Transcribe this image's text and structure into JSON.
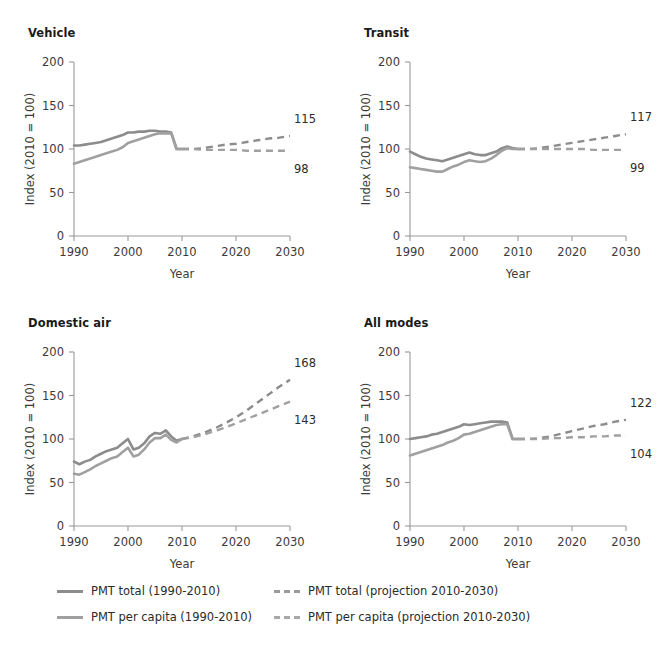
{
  "figure": {
    "width": 671,
    "height": 648,
    "background": "#ffffff"
  },
  "colors": {
    "series_total": "#8c8c8c",
    "series_per_capita": "#a0a0a0",
    "axis": "#9a9a9a",
    "text": "#2b2b2b",
    "title": "#1a1a1a"
  },
  "legend": {
    "position": "bottom",
    "items": [
      {
        "label": "PMT total (1990-2010)",
        "style": "solid",
        "color": "#8c8c8c",
        "column": "left"
      },
      {
        "label": "PMT per capita (1990-2010)",
        "style": "solid",
        "color": "#a0a0a0",
        "column": "left"
      },
      {
        "label": "PMT total (projection 2010-2030)",
        "style": "dashed",
        "color": "#9a9a9a",
        "column": "right"
      },
      {
        "label": "PMT per capita (projection 2010-2030)",
        "style": "dashed",
        "color": "#a8a8a8",
        "column": "right"
      }
    ]
  },
  "axes_common": {
    "xlabel": "Year",
    "ylabel": "Index (2010 = 100)",
    "xticks": [
      1990,
      2000,
      2010,
      2020,
      2030
    ],
    "yticks": [
      0,
      50,
      100,
      150,
      200
    ],
    "xlim": [
      1990,
      2030
    ],
    "ylim": [
      0,
      200
    ],
    "grid": false
  },
  "chart_data": [
    {
      "type": "line",
      "title": "Vehicle",
      "xlabel": "Year",
      "ylabel": "Index (2010 = 100)",
      "xlim": [
        1990,
        2030
      ],
      "ylim": [
        0,
        200
      ],
      "xticks": [
        1990,
        2000,
        2010,
        2020,
        2030
      ],
      "yticks": [
        0,
        50,
        100,
        150,
        200
      ],
      "grid": false,
      "annotations": [
        {
          "text": "115",
          "series": "PMT total (projection 2010-2030)",
          "x": 2030,
          "y": 115
        },
        {
          "text": "98",
          "series": "PMT per capita (projection 2010-2030)",
          "x": 2030,
          "y": 98
        }
      ],
      "series": [
        {
          "name": "PMT total (1990-2010)",
          "style": "solid",
          "x": [
            1990,
            1991,
            1992,
            1993,
            1994,
            1995,
            1996,
            1997,
            1998,
            1999,
            2000,
            2001,
            2002,
            2003,
            2004,
            2005,
            2006,
            2007,
            2008,
            2009,
            2010
          ],
          "values": [
            104,
            104,
            105,
            106,
            107,
            108,
            110,
            112,
            114,
            116,
            119,
            119,
            120,
            120,
            121,
            121,
            120,
            120,
            119,
            100,
            100
          ]
        },
        {
          "name": "PMT per capita (1990-2010)",
          "style": "solid",
          "x": [
            1990,
            1991,
            1992,
            1993,
            1994,
            1995,
            1996,
            1997,
            1998,
            1999,
            2000,
            2001,
            2002,
            2003,
            2004,
            2005,
            2006,
            2007,
            2008,
            2009,
            2010
          ],
          "values": [
            83,
            85,
            87,
            89,
            91,
            93,
            95,
            97,
            99,
            102,
            107,
            109,
            111,
            113,
            115,
            117,
            118,
            118,
            118,
            100,
            100
          ]
        },
        {
          "name": "PMT total (projection 2010-2030)",
          "style": "dashed",
          "x": [
            2010,
            2012,
            2014,
            2016,
            2018,
            2020,
            2022,
            2024,
            2026,
            2028,
            2030
          ],
          "values": [
            100,
            100,
            101,
            103,
            105,
            106,
            108,
            110,
            112,
            113,
            115
          ]
        },
        {
          "name": "PMT per capita (projection 2010-2030)",
          "style": "dashed",
          "x": [
            2010,
            2012,
            2014,
            2016,
            2018,
            2020,
            2022,
            2024,
            2026,
            2028,
            2030
          ],
          "values": [
            100,
            100,
            99,
            99,
            99,
            99,
            98,
            98,
            98,
            98,
            98
          ]
        }
      ]
    },
    {
      "type": "line",
      "title": "Transit",
      "xlabel": "Year",
      "ylabel": "Index (2010 = 100)",
      "xlim": [
        1990,
        2030
      ],
      "ylim": [
        0,
        200
      ],
      "xticks": [
        1990,
        2000,
        2010,
        2020,
        2030
      ],
      "yticks": [
        0,
        50,
        100,
        150,
        200
      ],
      "grid": false,
      "annotations": [
        {
          "text": "117",
          "series": "PMT total (projection 2010-2030)",
          "x": 2030,
          "y": 117
        },
        {
          "text": "99",
          "series": "PMT per capita (projection 2010-2030)",
          "x": 2030,
          "y": 99
        }
      ],
      "series": [
        {
          "name": "PMT total (1990-2010)",
          "style": "solid",
          "x": [
            1990,
            1991,
            1992,
            1993,
            1994,
            1995,
            1996,
            1997,
            1998,
            1999,
            2000,
            2001,
            2002,
            2003,
            2004,
            2005,
            2006,
            2007,
            2008,
            2009,
            2010
          ],
          "values": [
            97,
            94,
            91,
            89,
            88,
            87,
            86,
            88,
            90,
            92,
            94,
            96,
            94,
            93,
            93,
            95,
            97,
            101,
            103,
            101,
            100
          ]
        },
        {
          "name": "PMT per capita (1990-2010)",
          "style": "solid",
          "x": [
            1990,
            1991,
            1992,
            1993,
            1994,
            1995,
            1996,
            1997,
            1998,
            1999,
            2000,
            2001,
            2002,
            2003,
            2004,
            2005,
            2006,
            2007,
            2008,
            2009,
            2010
          ],
          "values": [
            79,
            78,
            77,
            76,
            75,
            74,
            74,
            77,
            80,
            82,
            85,
            87,
            86,
            85,
            86,
            89,
            93,
            98,
            101,
            100,
            100
          ]
        },
        {
          "name": "PMT total (projection 2010-2030)",
          "style": "dashed",
          "x": [
            2010,
            2012,
            2014,
            2016,
            2018,
            2020,
            2022,
            2024,
            2026,
            2028,
            2030
          ],
          "values": [
            100,
            100,
            101,
            103,
            105,
            107,
            109,
            111,
            113,
            115,
            117
          ]
        },
        {
          "name": "PMT per capita (projection 2010-2030)",
          "style": "dashed",
          "x": [
            2010,
            2012,
            2014,
            2016,
            2018,
            2020,
            2022,
            2024,
            2026,
            2028,
            2030
          ],
          "values": [
            100,
            100,
            100,
            100,
            100,
            100,
            100,
            99,
            99,
            99,
            99
          ]
        }
      ]
    },
    {
      "type": "line",
      "title": "Domestic air",
      "xlabel": "Year",
      "ylabel": "Index (2010 = 100)",
      "xlim": [
        1990,
        2030
      ],
      "ylim": [
        0,
        200
      ],
      "xticks": [
        1990,
        2000,
        2010,
        2020,
        2030
      ],
      "yticks": [
        0,
        50,
        100,
        150,
        200
      ],
      "grid": false,
      "annotations": [
        {
          "text": "168",
          "series": "PMT total (projection 2010-2030)",
          "x": 2030,
          "y": 168
        },
        {
          "text": "143",
          "series": "PMT per capita (projection 2010-2030)",
          "x": 2030,
          "y": 143
        }
      ],
      "series": [
        {
          "name": "PMT total (1990-2010)",
          "style": "solid",
          "x": [
            1990,
            1991,
            1992,
            1993,
            1994,
            1995,
            1996,
            1997,
            1998,
            1999,
            2000,
            2001,
            2002,
            2003,
            2004,
            2005,
            2006,
            2007,
            2008,
            2009,
            2010
          ],
          "values": [
            74,
            71,
            74,
            76,
            80,
            83,
            86,
            88,
            90,
            95,
            100,
            88,
            90,
            95,
            103,
            107,
            106,
            110,
            103,
            98,
            100
          ]
        },
        {
          "name": "PMT per capita (1990-2010)",
          "style": "solid",
          "x": [
            1990,
            1991,
            1992,
            1993,
            1994,
            1995,
            1996,
            1997,
            1998,
            1999,
            2000,
            2001,
            2002,
            2003,
            2004,
            2005,
            2006,
            2007,
            2008,
            2009,
            2010
          ],
          "values": [
            60,
            59,
            62,
            65,
            69,
            72,
            75,
            78,
            80,
            85,
            90,
            80,
            82,
            88,
            96,
            101,
            101,
            105,
            99,
            96,
            100
          ]
        },
        {
          "name": "PMT total (projection 2010-2030)",
          "style": "dashed",
          "x": [
            2010,
            2012,
            2014,
            2016,
            2018,
            2020,
            2022,
            2024,
            2026,
            2028,
            2030
          ],
          "values": [
            100,
            103,
            107,
            112,
            118,
            125,
            133,
            142,
            151,
            160,
            168
          ]
        },
        {
          "name": "PMT per capita (projection 2010-2030)",
          "style": "dashed",
          "x": [
            2010,
            2012,
            2014,
            2016,
            2018,
            2020,
            2022,
            2024,
            2026,
            2028,
            2030
          ],
          "values": [
            100,
            102,
            105,
            109,
            113,
            118,
            123,
            128,
            133,
            138,
            143
          ]
        }
      ]
    },
    {
      "type": "line",
      "title": "All modes",
      "xlabel": "Year",
      "ylabel": "Index (2010 = 100)",
      "xlim": [
        1990,
        2030
      ],
      "ylim": [
        0,
        200
      ],
      "xticks": [
        1990,
        2000,
        2010,
        2020,
        2030
      ],
      "yticks": [
        0,
        50,
        100,
        150,
        200
      ],
      "grid": false,
      "annotations": [
        {
          "text": "122",
          "series": "PMT total (projection 2010-2030)",
          "x": 2030,
          "y": 122
        },
        {
          "text": "104",
          "series": "PMT per capita (projection 2010-2030)",
          "x": 2030,
          "y": 104
        }
      ],
      "series": [
        {
          "name": "PMT total (1990-2010)",
          "style": "solid",
          "x": [
            1990,
            1991,
            1992,
            1993,
            1994,
            1995,
            1996,
            1997,
            1998,
            1999,
            2000,
            2001,
            2002,
            2003,
            2004,
            2005,
            2006,
            2007,
            2008,
            2009,
            2010
          ],
          "values": [
            100,
            101,
            102,
            103,
            105,
            106,
            108,
            110,
            112,
            114,
            117,
            116,
            117,
            118,
            119,
            120,
            120,
            120,
            119,
            100,
            100
          ]
        },
        {
          "name": "PMT per capita (1990-2010)",
          "style": "solid",
          "x": [
            1990,
            1991,
            1992,
            1993,
            1994,
            1995,
            1996,
            1997,
            1998,
            1999,
            2000,
            2001,
            2002,
            2003,
            2004,
            2005,
            2006,
            2007,
            2008,
            2009,
            2010
          ],
          "values": [
            81,
            83,
            85,
            87,
            89,
            91,
            93,
            96,
            98,
            101,
            105,
            106,
            108,
            110,
            112,
            114,
            116,
            117,
            117,
            100,
            100
          ]
        },
        {
          "name": "PMT total (projection 2010-2030)",
          "style": "dashed",
          "x": [
            2010,
            2012,
            2014,
            2016,
            2018,
            2020,
            2022,
            2024,
            2026,
            2028,
            2030
          ],
          "values": [
            100,
            100,
            101,
            103,
            106,
            109,
            112,
            115,
            117,
            120,
            122
          ]
        },
        {
          "name": "PMT per capita (projection 2010-2030)",
          "style": "dashed",
          "x": [
            2010,
            2012,
            2014,
            2016,
            2018,
            2020,
            2022,
            2024,
            2026,
            2028,
            2030
          ],
          "values": [
            100,
            100,
            100,
            101,
            101,
            102,
            102,
            103,
            103,
            104,
            104
          ]
        }
      ]
    }
  ]
}
